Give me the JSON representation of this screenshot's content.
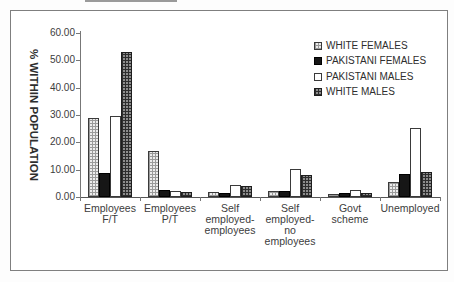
{
  "chart_data": {
    "type": "bar",
    "title": "",
    "xlabel": "",
    "ylabel": "% WITHIN POPULATION",
    "ylim": [
      0,
      60
    ],
    "ytick_step": 10,
    "ytick_labels_top_to_bottom": [
      "60.00",
      "50.00",
      "40.00",
      "30.00",
      "20.00",
      "10.00",
      "0.00"
    ],
    "grid": false,
    "legend_position": "upper-right",
    "categories": [
      "Employees\nF/T",
      "Employees\nP/T",
      "Self\nemployed-\nemployees",
      "Self\nemployed-\nno\nemployees",
      "Govt\nscheme",
      "Unemployed"
    ],
    "series": [
      {
        "name": "WHITE FEMALES",
        "fill": "light-grid",
        "values": [
          29.0,
          16.8,
          1.8,
          2.2,
          1.2,
          5.5
        ]
      },
      {
        "name": "PAKISTANI FEMALES",
        "fill": "solid",
        "values": [
          8.8,
          2.7,
          1.5,
          2.3,
          1.5,
          8.3
        ]
      },
      {
        "name": "PAKISTANI MALES",
        "fill": "hollow",
        "values": [
          29.5,
          2.2,
          4.3,
          10.4,
          2.7,
          25.3
        ]
      },
      {
        "name": "WHITE MALES",
        "fill": "dark-grid",
        "values": [
          53.0,
          1.8,
          3.9,
          7.9,
          1.6,
          9.0
        ]
      }
    ]
  },
  "colors": {
    "frame_border": "#7f7f7f",
    "axis": "#6f6f6f",
    "text": "#3c3c3c",
    "bar_solid": "#161616",
    "pattern_gray_light": "#9a9a9a",
    "pattern_gray_dark": "#2d2d2d"
  }
}
